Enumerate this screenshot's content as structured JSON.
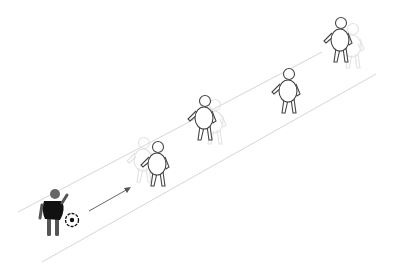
{
  "diagram": {
    "title": "",
    "colors": {
      "background": "#ffffff",
      "lane": "#d6d6d6",
      "player_with_ball": "#111111",
      "player_head": "#666666",
      "defender_outline": "#444444",
      "ghost_outline": "#e2e2e2",
      "arrow": "#555555"
    },
    "elements": {
      "attacker": {
        "label": "player-with-ball",
        "icon": "person-dark"
      },
      "ball": {
        "label": "soccer-ball",
        "icon": "soccer-ball"
      },
      "arrow": {
        "label": "dribble-direction",
        "icon": "arrow-right-up"
      },
      "defenders": [
        {
          "label": "defender-1",
          "icon": "person-outline"
        },
        {
          "label": "defender-2",
          "icon": "person-outline"
        },
        {
          "label": "defender-3",
          "icon": "person-outline"
        },
        {
          "label": "defender-4",
          "icon": "person-outline"
        }
      ]
    }
  }
}
